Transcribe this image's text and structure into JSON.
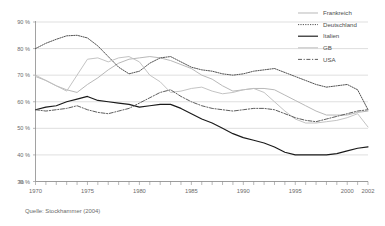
{
  "source_note": "Quelle: Stockhammer (2004)",
  "y_axis_unit": "%",
  "legend": {
    "position": "top-right",
    "items": [
      {
        "label": "Frankreich",
        "color": "#b4b4b4",
        "style": "solid"
      },
      {
        "label": "Deutschland",
        "color": "#4a4a4a",
        "style": "dotted"
      },
      {
        "label": "Italien",
        "color": "#1a1a1a",
        "style": "solid"
      },
      {
        "label": "GB",
        "color": "#c0c0c0",
        "style": "solid"
      },
      {
        "label": "USA",
        "color": "#555555",
        "style": "dash-dot"
      }
    ]
  },
  "chart_data": {
    "type": "line",
    "title": "",
    "subtitle": "",
    "xlabel": "",
    "ylabel": "%",
    "grid": true,
    "legend_position": "top-right",
    "xlim": [
      1970,
      2002
    ],
    "ylim": [
      30,
      90
    ],
    "y_ticks": [
      30,
      40,
      50,
      60,
      70,
      80,
      90
    ],
    "y_tick_labels": [
      "30 %",
      "40 %",
      "50 %",
      "60 %",
      "70 %",
      "80 %",
      "90 %"
    ],
    "x": [
      1970,
      1971,
      1972,
      1973,
      1974,
      1975,
      1976,
      1977,
      1978,
      1979,
      1980,
      1981,
      1982,
      1983,
      1984,
      1985,
      1986,
      1987,
      1988,
      1989,
      1990,
      1991,
      1992,
      1993,
      1994,
      1995,
      1996,
      1997,
      1998,
      1999,
      2000,
      2001,
      2002
    ],
    "x_tick_labels": [
      "1970",
      "1975",
      "1980",
      "1985",
      "1990",
      "1995",
      "2000",
      "2002"
    ],
    "x_tick_label_years": [
      1970,
      1975,
      1980,
      1985,
      1990,
      1995,
      2000,
      2002
    ],
    "series": [
      {
        "name": "Frankreich",
        "color": "#b4b4b4",
        "style": "solid",
        "values": [
          69.5,
          68.0,
          66.0,
          64.5,
          63.5,
          66.5,
          69.0,
          72.0,
          74.5,
          76.0,
          76.5,
          77.0,
          76.5,
          75.5,
          74.0,
          72.5,
          70.0,
          68.5,
          66.0,
          64.0,
          64.5,
          65.0,
          65.0,
          64.5,
          62.5,
          60.5,
          58.5,
          56.5,
          55.0,
          55.0,
          55.0,
          56.0,
          56.5
        ]
      },
      {
        "name": "Deutschland",
        "color": "#4a4a4a",
        "style": "dotted",
        "values": [
          80.0,
          82.0,
          83.5,
          84.8,
          85.0,
          84.0,
          81.0,
          77.0,
          73.0,
          70.5,
          71.5,
          74.5,
          76.5,
          77.0,
          75.0,
          73.0,
          72.0,
          71.5,
          70.5,
          70.0,
          70.5,
          71.5,
          72.0,
          72.5,
          71.0,
          69.5,
          68.0,
          66.5,
          65.5,
          66.0,
          66.5,
          64.5,
          57.0
        ]
      },
      {
        "name": "Italien",
        "color": "#1a1a1a",
        "style": "solid",
        "values": [
          57.0,
          58.0,
          58.5,
          60.0,
          61.0,
          62.0,
          60.5,
          60.0,
          59.5,
          59.0,
          58.0,
          58.5,
          59.0,
          59.0,
          57.5,
          55.5,
          53.5,
          52.0,
          50.0,
          48.0,
          46.5,
          45.5,
          44.5,
          43.0,
          41.0,
          40.0,
          40.0,
          40.0,
          40.0,
          40.5,
          41.5,
          42.5,
          43.0
        ]
      },
      {
        "name": "GB",
        "color": "#c0c0c0",
        "style": "solid",
        "values": [
          70.0,
          68.0,
          66.0,
          64.0,
          70.0,
          76.0,
          76.5,
          75.0,
          76.5,
          77.0,
          75.0,
          70.0,
          67.5,
          63.5,
          64.0,
          65.0,
          65.5,
          64.0,
          63.0,
          63.5,
          64.5,
          65.0,
          63.5,
          60.0,
          56.5,
          53.5,
          52.0,
          52.0,
          52.5,
          53.0,
          54.0,
          55.5,
          50.5
        ]
      },
      {
        "name": "USA",
        "color": "#555555",
        "style": "dash-dot",
        "values": [
          57.0,
          56.5,
          57.0,
          57.5,
          58.5,
          57.0,
          56.0,
          55.5,
          56.5,
          57.5,
          59.5,
          61.5,
          63.5,
          64.5,
          62.0,
          60.0,
          58.5,
          57.5,
          57.0,
          56.5,
          57.0,
          57.5,
          57.5,
          57.0,
          55.5,
          54.0,
          53.0,
          52.5,
          53.5,
          54.5,
          55.5,
          56.5,
          57.0
        ]
      }
    ]
  }
}
